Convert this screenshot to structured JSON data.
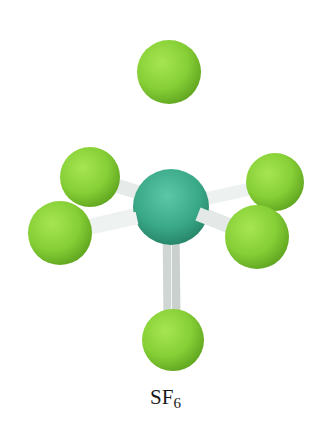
{
  "molecule": {
    "formula_main": "SF",
    "formula_subscript": "6",
    "central_atom": {
      "symbol": "S",
      "color": "#3fb08e",
      "cx": 171,
      "cy": 207,
      "r": 38
    },
    "ligand_color": "#8ad23a",
    "bond_color": "#eef1f0",
    "ligands": [
      {
        "name": "top",
        "cx": 169,
        "cy": 72,
        "r": 32
      },
      {
        "name": "upper-left",
        "cx": 90,
        "cy": 177,
        "r": 30
      },
      {
        "name": "lower-left",
        "cx": 60,
        "cy": 233,
        "r": 32
      },
      {
        "name": "upper-right",
        "cx": 275,
        "cy": 182,
        "r": 29
      },
      {
        "name": "lower-right",
        "cx": 257,
        "cy": 237,
        "r": 32
      },
      {
        "name": "bottom",
        "cx": 173,
        "cy": 340,
        "r": 31
      }
    ]
  }
}
